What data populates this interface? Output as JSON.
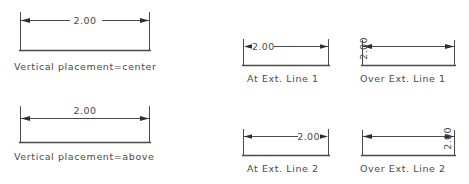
{
  "figure": {
    "title": "Dimension text placement examples",
    "line_color": "#4a4a4a",
    "text_color": "#4a4a4a",
    "background": "#ffffff"
  },
  "examples": [
    {
      "id": "vertical-center",
      "caption": "Vertical placement=center",
      "value": "2.00",
      "placement": "center",
      "orientation": "horizontal"
    },
    {
      "id": "vertical-above",
      "caption": "Vertical placement=above",
      "value": "2.00",
      "placement": "above",
      "orientation": "horizontal"
    },
    {
      "id": "at-ext-line-1",
      "caption": "At Ext. Line 1",
      "value": "2.00",
      "placement": "at-ext-line-1",
      "orientation": "horizontal"
    },
    {
      "id": "at-ext-line-2",
      "caption": "At Ext. Line 2",
      "value": "2.00",
      "placement": "at-ext-line-2",
      "orientation": "horizontal"
    },
    {
      "id": "over-ext-line-1",
      "caption": "Over Ext. Line 1",
      "value": "2.00",
      "placement": "over-ext-line-1",
      "orientation": "vertical"
    },
    {
      "id": "over-ext-line-2",
      "caption": "Over Ext. Line 2",
      "value": "2.00",
      "placement": "over-ext-line-2",
      "orientation": "vertical"
    }
  ]
}
